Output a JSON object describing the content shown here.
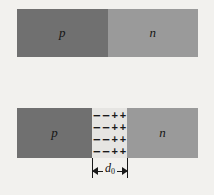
{
  "figure": {
    "background_color": "#f2f1ee",
    "p_region_color": "#707070",
    "n_region_color": "#9a9a9a",
    "depletion_color": "#e6e5e2",
    "ink_color": "#1a1a1a"
  },
  "top_diagram": {
    "name": "pn-junction-unbiased-blocks",
    "p_label": "p",
    "n_label": "n"
  },
  "bottom_diagram": {
    "name": "pn-junction-with-depletion-region",
    "p_label": "p",
    "n_label": "n",
    "depletion": {
      "negative_symbol": "−",
      "positive_symbol": "+",
      "rows": 4,
      "negatives_per_row": 2,
      "positives_per_row": 2
    }
  },
  "dimension": {
    "label": "d",
    "subscript": "0",
    "left_arrow": "←",
    "right_arrow": "→"
  }
}
